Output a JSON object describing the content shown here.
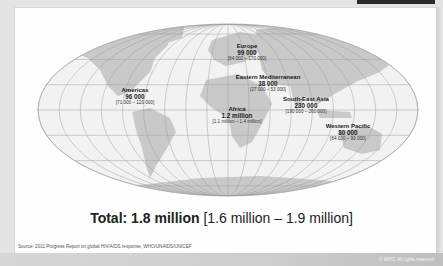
{
  "map": {
    "regions": [
      {
        "id": "europe",
        "name": "Europe",
        "value": "99 000",
        "range": "[84 000 – 170 000]"
      },
      {
        "id": "eastern-mediterranean",
        "name": "Eastern Mediterranean",
        "value": "38 000",
        "range": "[27 000 – 53 000]"
      },
      {
        "id": "americas",
        "name": "Americas",
        "value": "96 000",
        "range": "[71 000 – 120 000]"
      },
      {
        "id": "south-east-asia",
        "name": "South-East Asia",
        "value": "230 000",
        "range": "[190 000 – 260 000]"
      },
      {
        "id": "africa",
        "name": "Africa",
        "value": "1.2 million",
        "range": "[1.1 million – 1.4 million]"
      },
      {
        "id": "western-pacific",
        "name": "Western Pacific",
        "value": "80 000",
        "range": "[64 000 – 99 000]"
      }
    ],
    "colors": {
      "ocean": "#f2f2f2",
      "land": "#c9c9c9",
      "grid": "#9a9a9a"
    }
  },
  "total": {
    "label": "Total:",
    "value": "1.8 million",
    "range": "[1.6 million – 1.9 million]"
  },
  "source": "Source: 2011 Progress Report on global HIV/AIDS response, WHO/UNAIDS/UNICEF",
  "copyright": "© WHO. All rights reserved"
}
